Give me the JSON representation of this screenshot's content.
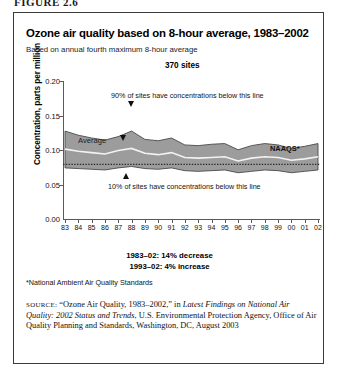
{
  "figure_label": "FIGURE 2.6",
  "chart": {
    "title": "Ozone air quality based on 8-hour average, 1983–2002",
    "subtitle": "Based on annual fourth maximum 8-hour average",
    "sites_note": "370 sites",
    "average_label": "Average",
    "naaqs_label": "NAAQS*",
    "annotation_upper": "90% of sites have concentrations below this line",
    "annotation_lower": "10% of sites have concentrations below this line",
    "trend_1": "1983–02: 14% decrease",
    "trend_2": "1993–02: 4% increase"
  },
  "footnote": "*National Ambient Air Quality Standards",
  "source": {
    "keyword": "SOURCE:",
    "part1": " “Ozone Air Quality, 1983–2002,” in ",
    "italic1": "Latest Findings on National Air Quality: 2002 Status and Trends",
    "part2": ", U.S. Environmental Protection Agency, Office of Air Quality Planning and Standards, Washington, DC, August 2003"
  },
  "colors": {
    "band_fill": "#9c9c9c",
    "band_edge": "#4a4a4a",
    "average_line": "#f2f2f2",
    "naaqs_line": "#2b2b2b",
    "axis": "#5a5a5a",
    "frame": "#3a3a3a"
  },
  "chart_data": {
    "type": "area",
    "title": "Ozone air quality based on 8-hour average, 1983–2002",
    "subtitle": "Based on annual fourth maximum 8-hour average",
    "xlabel": "",
    "ylabel": "Concentration, parts per million",
    "ylim": [
      0.0,
      0.2
    ],
    "yticks": [
      "0.00",
      "0.05",
      "0.10",
      "0.15",
      "0.20"
    ],
    "ytick_values": [
      0.0,
      0.05,
      0.1,
      0.15,
      0.2
    ],
    "grid": false,
    "legend": "inline annotations",
    "categories": [
      "83",
      "84",
      "85",
      "86",
      "87",
      "88",
      "89",
      "90",
      "91",
      "92",
      "93",
      "94",
      "95",
      "96",
      "97",
      "98",
      "99",
      "00",
      "01",
      "02"
    ],
    "x_full_years": [
      1983,
      1984,
      1985,
      1986,
      1987,
      1988,
      1989,
      1990,
      1991,
      1992,
      1993,
      1994,
      1995,
      1996,
      1997,
      1998,
      1999,
      2000,
      2001,
      2002
    ],
    "series": [
      {
        "name": "90% of sites have concentrations below this line",
        "role": "band_upper",
        "values": [
          0.128,
          0.122,
          0.118,
          0.115,
          0.12,
          0.128,
          0.116,
          0.114,
          0.118,
          0.108,
          0.107,
          0.109,
          0.11,
          0.101,
          0.107,
          0.11,
          0.108,
          0.103,
          0.106,
          0.11
        ]
      },
      {
        "name": "Average",
        "role": "mean_line",
        "values": [
          0.102,
          0.099,
          0.097,
          0.095,
          0.1,
          0.103,
          0.096,
          0.094,
          0.097,
          0.09,
          0.089,
          0.09,
          0.091,
          0.085,
          0.089,
          0.091,
          0.09,
          0.086,
          0.088,
          0.091
        ]
      },
      {
        "name": "10% of sites have concentrations below this line",
        "role": "band_lower",
        "values": [
          0.075,
          0.074,
          0.073,
          0.072,
          0.075,
          0.077,
          0.074,
          0.073,
          0.075,
          0.071,
          0.07,
          0.071,
          0.072,
          0.068,
          0.07,
          0.072,
          0.071,
          0.068,
          0.07,
          0.072
        ]
      },
      {
        "name": "NAAQS*",
        "role": "reference_line",
        "value": 0.08,
        "style": "dotted"
      }
    ],
    "annotations": [
      {
        "text": "370 sites",
        "kind": "count"
      },
      {
        "text": "1983–02: 14% decrease",
        "kind": "trend"
      },
      {
        "text": "1993–02: 4% increase",
        "kind": "trend"
      }
    ]
  }
}
